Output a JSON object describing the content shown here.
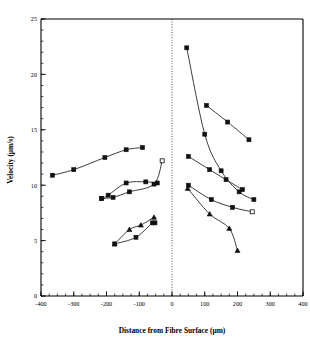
{
  "chart_data": {
    "type": "scatter",
    "title": "",
    "xlabel": "Distance from Fibre Surface (µm)",
    "ylabel": "Velocity  (µm/s)",
    "xlim": [
      -400,
      400
    ],
    "ylim": [
      0,
      25
    ],
    "xticks": [
      -400,
      -300,
      -200,
      -100,
      0,
      100,
      200,
      300,
      400
    ],
    "xticklabels": [
      "-400",
      "-300",
      "-200",
      "-100",
      "0",
      "100",
      "200",
      "300",
      "400"
    ],
    "yticks": [
      0,
      5,
      10,
      15,
      20,
      25
    ],
    "yticklabels": [
      "0",
      "5",
      "10",
      "15",
      "20",
      "25"
    ],
    "x_minor_interval": 25,
    "y_minor_interval": 1,
    "grid": false,
    "legend": "none",
    "annotations": [
      {
        "name": "fibre-surface-reference-line",
        "x": 0,
        "style": "dotted-vertical"
      }
    ],
    "series": [
      {
        "name": "left-upper",
        "side": "left",
        "marker": "square-filled",
        "points": [
          {
            "x": -365,
            "y": 10.9
          },
          {
            "x": -300,
            "y": 11.4
          },
          {
            "x": -205,
            "y": 12.5
          },
          {
            "x": -140,
            "y": 13.2
          },
          {
            "x": -90,
            "y": 13.4
          }
        ]
      },
      {
        "name": "left-middle-a",
        "side": "left",
        "marker": "square-filled",
        "points": [
          {
            "x": -215,
            "y": 8.8
          },
          {
            "x": -195,
            "y": 9.1
          },
          {
            "x": -140,
            "y": 10.2
          },
          {
            "x": -80,
            "y": 10.3
          },
          {
            "x": -45,
            "y": 10.2
          }
        ]
      },
      {
        "name": "left-middle-b",
        "side": "left",
        "marker": "square-filled",
        "points": [
          {
            "x": -215,
            "y": 8.8
          },
          {
            "x": -180,
            "y": 8.9
          },
          {
            "x": -130,
            "y": 9.4
          },
          {
            "x": -55,
            "y": 10.1
          },
          {
            "x": -30,
            "y": 12.2
          }
        ],
        "last_marker": "square-open"
      },
      {
        "name": "left-lower-a",
        "side": "left",
        "marker": "triangle-filled",
        "points": [
          {
            "x": -175,
            "y": 4.7
          },
          {
            "x": -130,
            "y": 6.0
          },
          {
            "x": -95,
            "y": 6.4
          },
          {
            "x": -55,
            "y": 7.1
          }
        ]
      },
      {
        "name": "left-lower-b",
        "side": "left",
        "marker": "square-filled",
        "points": [
          {
            "x": -175,
            "y": 4.7
          },
          {
            "x": -110,
            "y": 5.3
          },
          {
            "x": -60,
            "y": 6.6
          },
          {
            "x": -52,
            "y": 6.6
          }
        ]
      },
      {
        "name": "right-top",
        "side": "right",
        "marker": "square-filled",
        "points": [
          {
            "x": 45,
            "y": 22.4
          },
          {
            "x": 100,
            "y": 14.6
          },
          {
            "x": 150,
            "y": 11.3
          },
          {
            "x": 205,
            "y": 9.4
          },
          {
            "x": 250,
            "y": 8.7
          }
        ]
      },
      {
        "name": "right-second",
        "side": "right",
        "marker": "square-filled",
        "points": [
          {
            "x": 105,
            "y": 17.2
          },
          {
            "x": 170,
            "y": 15.7
          },
          {
            "x": 235,
            "y": 14.1
          }
        ]
      },
      {
        "name": "right-third",
        "side": "right",
        "marker": "square-filled",
        "points": [
          {
            "x": 50,
            "y": 12.6
          },
          {
            "x": 115,
            "y": 11.4
          },
          {
            "x": 165,
            "y": 10.5
          },
          {
            "x": 215,
            "y": 9.6
          }
        ]
      },
      {
        "name": "right-fourth",
        "side": "right",
        "marker": "square-filled",
        "points": [
          {
            "x": 50,
            "y": 10.0
          },
          {
            "x": 120,
            "y": 8.7
          },
          {
            "x": 185,
            "y": 8.0
          },
          {
            "x": 245,
            "y": 7.6
          }
        ],
        "last_marker": "square-open"
      },
      {
        "name": "right-fifth",
        "side": "right",
        "marker": "triangle-filled",
        "points": [
          {
            "x": 48,
            "y": 9.7
          },
          {
            "x": 115,
            "y": 7.4
          },
          {
            "x": 175,
            "y": 6.1
          },
          {
            "x": 200,
            "y": 4.1
          }
        ]
      }
    ]
  },
  "colors": {
    "axis": "#000000",
    "marker": "#111111",
    "line": "#1a1a1a",
    "background": "#ffffff"
  }
}
